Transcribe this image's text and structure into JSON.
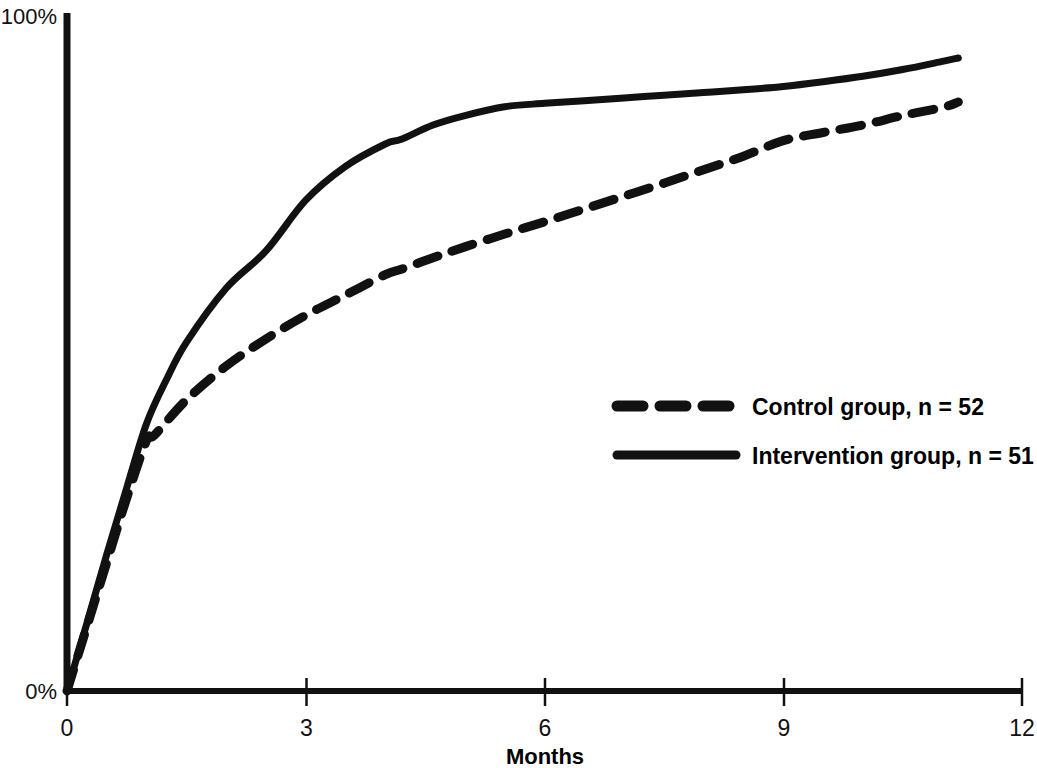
{
  "chart_data": {
    "type": "line",
    "title": "",
    "subtitle": "",
    "xlabel": "Months",
    "ylabel": "",
    "xlim": [
      0,
      12
    ],
    "ylim": [
      0,
      100
    ],
    "grid": false,
    "legend_position": "center-right",
    "x_tick_labels": [
      "0",
      "3",
      "6",
      "9",
      "12"
    ],
    "x_tick_values": [
      0,
      3,
      6,
      9,
      12
    ],
    "y_tick_labels": [
      "0%",
      "100%"
    ],
    "y_tick_values": [
      0,
      100
    ],
    "series": [
      {
        "name": "Control group, n = 52",
        "style": "dashed",
        "n": 52,
        "x": [
          0,
          0.25,
          0.5,
          0.75,
          1.0,
          1.1,
          1.5,
          2.0,
          2.5,
          3.0,
          3.5,
          4.0,
          4.2,
          4.6,
          5.0,
          5.5,
          6.0,
          6.5,
          7.0,
          7.5,
          8.0,
          8.5,
          9.0,
          9.5,
          10.0,
          10.5,
          11.0,
          11.2
        ],
        "y": [
          0,
          9.5,
          19.0,
          28.5,
          37.0,
          37.8,
          43.0,
          48.0,
          52.0,
          55.5,
          58.5,
          61.5,
          62.3,
          64.0,
          65.6,
          67.5,
          69.3,
          71.2,
          73.1,
          75.0,
          77.0,
          79.0,
          81.3,
          82.5,
          83.6,
          85.0,
          86.2,
          87.0
        ]
      },
      {
        "name": "Intervention group, n = 51",
        "style": "solid",
        "n": 51,
        "x": [
          0,
          0.25,
          0.5,
          0.75,
          1.0,
          1.25,
          1.5,
          2.0,
          2.5,
          3.0,
          3.5,
          4.0,
          4.2,
          4.6,
          5.0,
          5.5,
          6.0,
          6.5,
          7.0,
          7.5,
          8.0,
          8.5,
          9.0,
          9.5,
          10.0,
          10.5,
          11.0,
          11.2
        ],
        "y": [
          0,
          10.0,
          20.2,
          30.0,
          39.5,
          46.0,
          51.5,
          59.5,
          65.0,
          72.5,
          77.5,
          80.8,
          81.5,
          83.6,
          85.0,
          86.3,
          86.8,
          87.2,
          87.6,
          88.0,
          88.4,
          88.8,
          89.3,
          90.0,
          90.8,
          91.8,
          93.0,
          93.5
        ]
      }
    ],
    "legend": [
      {
        "label": "Control group, n = 52",
        "style": "dashed"
      },
      {
        "label": "Intervention group, n = 51",
        "style": "solid"
      }
    ],
    "colors": {
      "line": "#111111",
      "axis": "#111111",
      "background": "#ffffff"
    }
  },
  "axes": {
    "y_top_label": "100%",
    "y_bottom_label": "0%",
    "x_title": "Months"
  },
  "x_ticks": [
    {
      "label": "0"
    },
    {
      "label": "3"
    },
    {
      "label": "6"
    },
    {
      "label": "9"
    },
    {
      "label": "12"
    }
  ],
  "legend": {
    "item_0_label": "Control group, n = 52",
    "item_1_label": "Intervention group, n = 51"
  }
}
